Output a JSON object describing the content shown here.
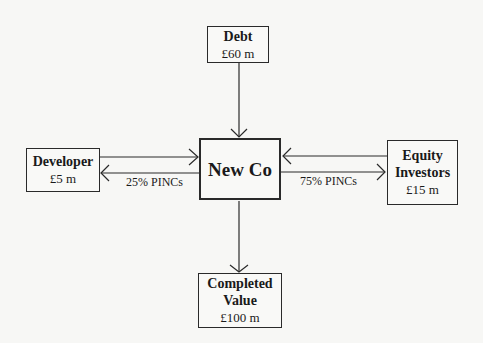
{
  "diagram": {
    "nodes": {
      "debt": {
        "title": "Debt",
        "value": "£60 m"
      },
      "center": {
        "title": "New Co"
      },
      "developer": {
        "title": "Developer",
        "value": "£5 m"
      },
      "equity": {
        "title_line1": "Equity",
        "title_line2": "Investors",
        "value": "£15 m"
      },
      "completed": {
        "title_line1": "Completed",
        "title_line2": "Value",
        "value": "£100 m"
      }
    },
    "edges": {
      "developer_label": "25% PINCs",
      "equity_label": "75% PINCs"
    },
    "colors": {
      "line": "#2a2a2a",
      "background": "#f7f7f5"
    }
  }
}
